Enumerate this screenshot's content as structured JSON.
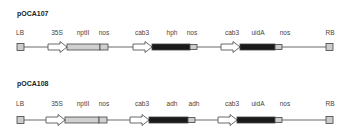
{
  "constructs": [
    {
      "name": "pOCA107",
      "labels": [
        {
          "text": "LB",
          "x": 20
        },
        {
          "text": "35S",
          "x": 57
        },
        {
          "text": "nptII",
          "x": 83
        },
        {
          "text": "nos",
          "x": 104
        },
        {
          "text": "cab3",
          "x": 142
        },
        {
          "text": "hph",
          "x": 172
        },
        {
          "text": "nos",
          "x": 192
        },
        {
          "text": "cab3",
          "x": 232
        },
        {
          "text": "uidA",
          "x": 258
        },
        {
          "text": "nos",
          "x": 285
        },
        {
          "text": "RB",
          "x": 330
        }
      ]
    },
    {
      "name": "pOCA108",
      "labels": [
        {
          "text": "LB",
          "x": 20
        },
        {
          "text": "35S",
          "x": 57
        },
        {
          "text": "nptII",
          "x": 83
        },
        {
          "text": "nos",
          "x": 104
        },
        {
          "text": "cab3",
          "x": 142
        },
        {
          "text": "adh",
          "x": 172
        },
        {
          "text": "adh",
          "x": 194
        },
        {
          "text": "cab3",
          "x": 232
        },
        {
          "text": "uidA",
          "x": 258
        },
        {
          "text": "nos",
          "x": 285
        },
        {
          "text": "RB",
          "x": 330
        }
      ]
    }
  ],
  "colors": {
    "dark_block": "#1a1a1a",
    "grey_block": "#cccccc",
    "arrow_fill": "#ffffff",
    "line": "#444444"
  }
}
